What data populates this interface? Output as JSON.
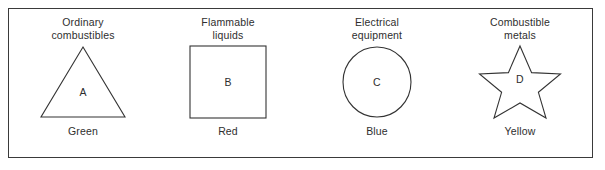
{
  "figure": {
    "name": "fire-class-chart",
    "frame_color": "#3a3a3a",
    "background": "#ffffff"
  },
  "panels": [
    {
      "title": "Ordinary\ncombustibles",
      "shape": "triangle",
      "letter": "A",
      "color_label": "Green",
      "color_hex": "#008000"
    },
    {
      "title": "Flammable\nliquids",
      "shape": "square",
      "letter": "B",
      "color_label": "Red",
      "color_hex": "#ff0000"
    },
    {
      "title": "Electrical\nequipment",
      "shape": "circle",
      "letter": "C",
      "color_label": "Blue",
      "color_hex": "#0000ff"
    },
    {
      "title": "Combustible\nmetals",
      "shape": "star",
      "letter": "D",
      "color_label": "Yellow",
      "color_hex": "#ffff00"
    }
  ]
}
